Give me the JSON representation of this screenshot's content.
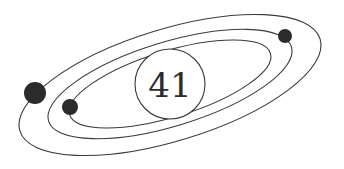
{
  "diagram": {
    "type": "orbital-illustration",
    "center_label": "41",
    "colors": {
      "background": "#ffffff",
      "stroke": "#3a3a3a",
      "planet": "#2b2b2b"
    },
    "orbits": [
      {
        "name": "outer-orbit",
        "cx": 170,
        "cy": 85,
        "rx": 157,
        "ry": 56,
        "rotate": -17
      },
      {
        "name": "middle-orbit",
        "cx": 170,
        "cy": 84,
        "rx": 127,
        "ry": 42,
        "rotate": -17
      },
      {
        "name": "inner-orbit",
        "cx": 170,
        "cy": 84,
        "rx": 105,
        "ry": 33,
        "rotate": -17
      }
    ],
    "core": {
      "cx": 170,
      "cy": 84,
      "r": 35
    },
    "planets": [
      {
        "name": "large-planet",
        "cx": 35,
        "cy": 93,
        "r": 11
      },
      {
        "name": "small-planet-left",
        "cx": 70,
        "cy": 107,
        "r": 8
      },
      {
        "name": "small-planet-right",
        "cx": 285,
        "cy": 36,
        "r": 7
      }
    ]
  }
}
